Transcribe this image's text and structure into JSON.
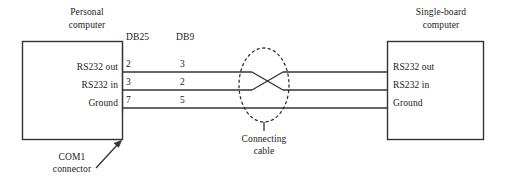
{
  "diagram": {
    "type": "rs232-serial-connection-diagram",
    "left_device": {
      "title_line1": "Personal",
      "title_line2": "computer",
      "ports": [
        "RS232 out",
        "RS232 in",
        "Ground"
      ],
      "connector_label_line1": "COM1",
      "connector_label_line2": "connector"
    },
    "right_device": {
      "title_line1": "Single-board",
      "title_line2": "computer",
      "ports": [
        "RS232 out",
        "RS232 in",
        "Ground"
      ]
    },
    "pin_columns": [
      {
        "header": "DB25",
        "pins": [
          "2",
          "3",
          "7"
        ]
      },
      {
        "header": "DB9",
        "pins": [
          "3",
          "2",
          "5"
        ]
      }
    ],
    "cable": {
      "label_line1": "Connecting",
      "label_line2": "cable",
      "crossover": true
    },
    "colors": {
      "line": "#333333",
      "text": "#1a1a1a",
      "background": "#ffffff"
    }
  }
}
